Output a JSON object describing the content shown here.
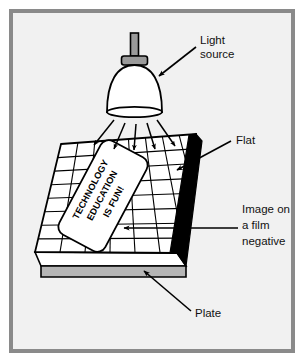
{
  "figure": {
    "background_color": "#f1f1f1",
    "frame_color": "#8a8a8a",
    "page_color": "#ffffff",
    "line_color": "#000000"
  },
  "labels": [
    {
      "id": "light-source",
      "lines": [
        "Light",
        "source"
      ],
      "line1": "Light",
      "line2": "source"
    },
    {
      "id": "flat",
      "lines": [
        "Flat"
      ],
      "line1": "Flat"
    },
    {
      "id": "film-negative",
      "lines": [
        "Image on",
        "a film",
        "negative"
      ],
      "line1": "Image on",
      "line2": "a film",
      "line3": "negative"
    },
    {
      "id": "plate",
      "lines": [
        "Plate"
      ],
      "line1": "Plate"
    }
  ],
  "negative": {
    "line1": "TECHNOLOGY",
    "line2": "EDUCATION",
    "line3": "IS FUN!",
    "fill_color": "#ffffff",
    "text_color": "#000000"
  },
  "lamp": {
    "stem_color": "#9a9a9a",
    "collar_color": "#9a9a9a",
    "dome_color": "#ffffff",
    "ray_count": 5
  },
  "flat": {
    "grid_columns": 8,
    "grid_rows": 8,
    "surface_color": "#ffffff",
    "edge_shadow_color": "#000000"
  },
  "plate": {
    "face_color": "#ffffff",
    "side_color": "#b5b5b5"
  }
}
